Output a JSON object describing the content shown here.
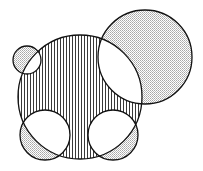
{
  "diagram": {
    "title": "",
    "colors": {
      "stroke": "#111111",
      "hatch": "#222222",
      "stipple": "#777777",
      "background": "#ffffff"
    },
    "main_circle": {
      "id": "main",
      "cx": 80,
      "cy": 97,
      "r": 62,
      "fill": "vertical-hatch"
    },
    "circles": [
      {
        "id": "small-top-left",
        "cx": 27,
        "cy": 60,
        "r": 14
      },
      {
        "id": "large-top-right",
        "cx": 145,
        "cy": 57,
        "r": 47
      },
      {
        "id": "bottom-left",
        "cx": 45,
        "cy": 135,
        "r": 25
      },
      {
        "id": "bottom-right",
        "cx": 113,
        "cy": 135,
        "r": 25
      }
    ],
    "fill_rules": {
      "main_only": "vertical-hatch",
      "secondary_only": "stipple",
      "overlap": "white"
    }
  }
}
